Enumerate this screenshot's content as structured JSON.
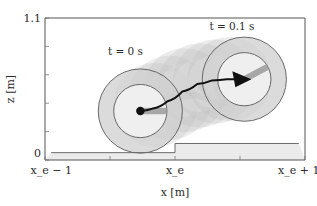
{
  "figure": {
    "type": "plot"
  },
  "axes": {
    "x_title": "x [m]",
    "y_title": "z [m]",
    "x_tick_labels": [
      "x_e − 1",
      "x_e",
      "x_e + 1"
    ],
    "x_tick_values": [
      -1,
      0,
      1
    ],
    "y_tick_labels": [
      "0",
      "1.1"
    ],
    "y_tick_values": [
      0,
      1.1
    ],
    "x_range": [
      -1.05,
      1.05
    ],
    "y_range": [
      -0.06,
      1.1
    ],
    "grid": "off"
  },
  "annotations": [
    {
      "label": "t = 0 s",
      "x": -0.4,
      "y": 0.8
    },
    {
      "label": "t = 0.1 s",
      "x": 0.46,
      "y": 1.0
    }
  ],
  "chart_data": {
    "type": "line",
    "title": "",
    "xlabel": "x [m]",
    "ylabel": "z [m]",
    "xlim": [
      -1.05,
      1.05
    ],
    "ylim": [
      -0.06,
      1.1
    ],
    "grid": false,
    "series": [
      {
        "name": "wheel-center trajectory",
        "x": [
          -0.28,
          -0.18,
          -0.06,
          0.06,
          0.18,
          0.3,
          0.42,
          0.52
        ],
        "y": [
          0.34,
          0.36,
          0.42,
          0.5,
          0.56,
          0.59,
          0.6,
          0.6
        ]
      },
      {
        "name": "terrain step profile",
        "x": [
          -1.0,
          0.0,
          0.0,
          1.0
        ],
        "y": [
          0.0,
          0.0,
          0.075,
          0.075
        ]
      }
    ],
    "markers": [
      {
        "name": "wheel-center-t0",
        "x": -0.28,
        "y": 0.34
      },
      {
        "name": "arrow-head-t1",
        "x": 0.52,
        "y": 0.6
      }
    ],
    "wheels": [
      {
        "name": "wheel-t0",
        "cx": -0.28,
        "cy": 0.34,
        "r_outer": 0.34,
        "r_inner": 0.215
      },
      {
        "name": "wheel-t1",
        "cx": 0.56,
        "cy": 0.6,
        "r_outer": 0.34,
        "r_inner": 0.215
      }
    ],
    "ghost_wheels": [
      {
        "cx": -0.16,
        "cy": 0.39
      },
      {
        "cx": -0.04,
        "cy": 0.45
      },
      {
        "cx": 0.08,
        "cy": 0.51
      },
      {
        "cx": 0.2,
        "cy": 0.55
      },
      {
        "cx": 0.32,
        "cy": 0.58
      },
      {
        "cx": 0.44,
        "cy": 0.6
      }
    ]
  },
  "colors": {
    "axis": "#555555",
    "tire": "#cfcfcf",
    "hub": "#f2f2f2",
    "ground": "#ebebeb",
    "trajectory": "#111111",
    "ghost": "#b8b8b8"
  }
}
